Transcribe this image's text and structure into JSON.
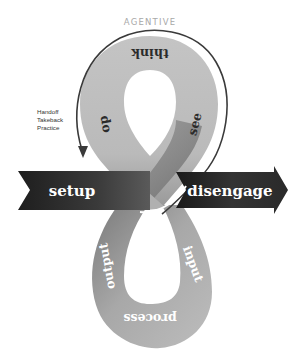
{
  "diagram": {
    "title": "AGENTIVE",
    "side_notes": [
      "Handoff",
      "Takeback",
      "Practice"
    ],
    "upper_loop": {
      "top": "think",
      "left": "do",
      "right": "see"
    },
    "lower_loop": {
      "left": "output",
      "right": "input",
      "bottom": "process"
    },
    "bands": {
      "left": "setup",
      "right": "disengage"
    },
    "colors": {
      "loop_fill": "#bdbdbd",
      "loop_shadow": "#8a8a8a",
      "band_dark": "#2a2a2a",
      "band_mid": "#4a4a4a",
      "outline_arc": "#3a3a3a",
      "title_gray": "#a8a8a8"
    }
  }
}
